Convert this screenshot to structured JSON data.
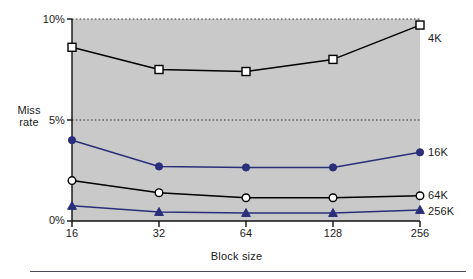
{
  "chart_data": {
    "type": "line",
    "title": "",
    "xlabel": "Block size",
    "ylabel": "Miss rate",
    "x": [
      16,
      32,
      64,
      128,
      256
    ],
    "xtick_labels": [
      "16",
      "32",
      "64",
      "128",
      "256"
    ],
    "ytick_labels": [
      "0%",
      "5%",
      "10%"
    ],
    "ytick_values": [
      0,
      5,
      10
    ],
    "ylim": [
      0,
      10
    ],
    "xscale": "log2-categorical",
    "grid": "horizontal-dotted",
    "legend_position": "right-of-plot-line-end",
    "plot_background": "#c9c9c9",
    "series": [
      {
        "name": "4K",
        "label": "4K",
        "marker": "open-square",
        "color": "#000000",
        "values": [
          8.6,
          7.5,
          7.4,
          8.0,
          9.7
        ]
      },
      {
        "name": "16K",
        "label": "16K",
        "marker": "filled-circle",
        "color": "#2b2f7a",
        "values": [
          4.0,
          2.7,
          2.65,
          2.65,
          3.4
        ]
      },
      {
        "name": "64K",
        "label": "64K",
        "marker": "open-circle",
        "color": "#000000",
        "values": [
          2.0,
          1.4,
          1.15,
          1.15,
          1.25
        ]
      },
      {
        "name": "256K",
        "label": "256K",
        "marker": "filled-triangle",
        "color": "#2b2f7a",
        "values": [
          0.75,
          0.45,
          0.4,
          0.4,
          0.55
        ]
      }
    ]
  },
  "axes": {
    "y_title_line1": "Miss",
    "y_title_line2": "rate",
    "y_ticks": {
      "t10": "10%",
      "t5": "5%",
      "t0": "0%"
    },
    "x_ticks": [
      "16",
      "32",
      "64",
      "128",
      "256"
    ],
    "x_title": "Block size"
  },
  "series_labels": {
    "s4k": "4K",
    "s16k": "16K",
    "s64k": "64K",
    "s256k": "256K"
  }
}
